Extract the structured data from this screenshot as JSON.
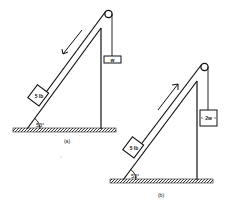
{
  "figure": {
    "panels": [
      {
        "id": "a",
        "caption": "(a)",
        "angle_label": "53°",
        "block_label": "5 lb",
        "hanging_label": "w",
        "motion": "down the incline"
      },
      {
        "id": "b",
        "caption": "(b)",
        "angle_label": "53°",
        "block_label": "5 lb",
        "hanging_label": "2w",
        "motion": "up the incline"
      }
    ],
    "colors": {
      "ink": "#111111",
      "background": "#ffffff"
    }
  }
}
